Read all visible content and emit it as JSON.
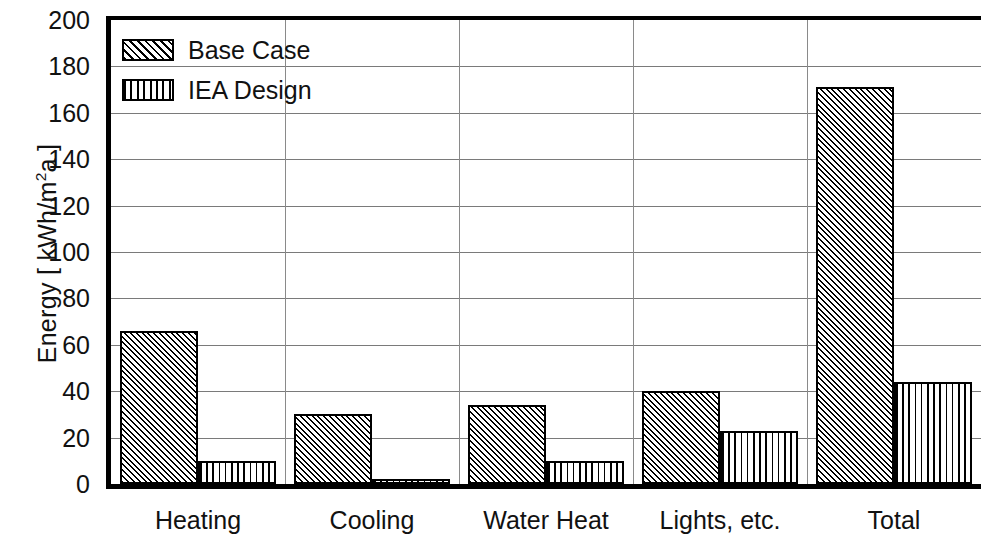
{
  "chart_data": {
    "type": "bar",
    "title": "",
    "xlabel": "",
    "ylabel": "Energy [ kWh/m²a ]",
    "ylabel_parts": {
      "prefix": "Energy  [ kWh/m",
      "sup": "2",
      "suffix": "a ]"
    },
    "categories": [
      "Heating",
      "Cooling",
      "Water Heat",
      "Lights, etc.",
      "Total"
    ],
    "series": [
      {
        "name": "Base Case",
        "pattern": "diagonal-hatch",
        "values": [
          66,
          30,
          34,
          40,
          171
        ]
      },
      {
        "name": "IEA Design",
        "pattern": "vertical-stripes",
        "values": [
          10,
          2,
          10,
          23,
          44
        ]
      }
    ],
    "ylim": [
      0,
      200
    ],
    "yticks": [
      0,
      20,
      40,
      60,
      80,
      100,
      120,
      140,
      160,
      180,
      200
    ],
    "ytick_labels": [
      "0",
      "20",
      "40",
      "60",
      "80",
      "100",
      "120",
      "140",
      "160",
      "180",
      "200"
    ],
    "grid": {
      "horizontal": true,
      "vertical": true
    },
    "legend": {
      "position": "top-left",
      "entries": [
        "Base Case",
        "IEA Design"
      ]
    },
    "colors": {
      "ink": "#000000",
      "grid": "#7a7a7a",
      "background": "#ffffff"
    }
  }
}
